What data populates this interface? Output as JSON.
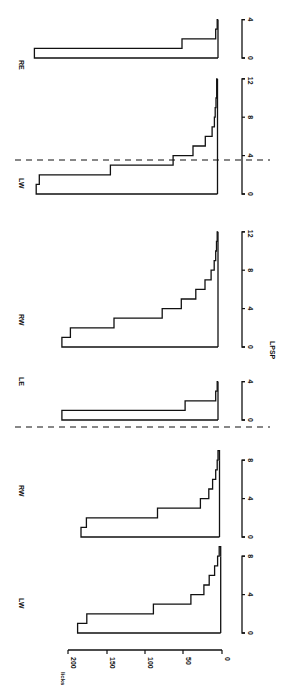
{
  "chart_data": {
    "type": "bar",
    "orientation": "rotated 90deg clockwise (histograms drawn as step outlines)",
    "title": "",
    "xlabel": "LPSP",
    "ylabel": "licks",
    "ylim": [
      0,
      200
    ],
    "yticks": [
      "0",
      "50",
      "100",
      "150",
      "200"
    ],
    "grid": false,
    "legend": null,
    "separators": "dashed lines between the three groups",
    "groups": [
      {
        "panels": [
          {
            "label": "LW",
            "xlim": [
              0,
              8
            ],
            "xticks": [
              "0",
              "4",
              "8"
            ],
            "bins": [
              0,
              1,
              2,
              3,
              4,
              5,
              6,
              7,
              8
            ],
            "values": [
              187,
              175,
              88,
              39,
              22,
              15,
              8,
              4,
              2
            ]
          },
          {
            "label": "RW",
            "xlim": [
              0,
              8
            ],
            "xticks": [
              "0",
              "4",
              "8"
            ],
            "bins": [
              0,
              1,
              2,
              3,
              4,
              5,
              6,
              7,
              8
            ],
            "values": [
              181,
              174,
              81,
              25,
              14,
              9,
              5,
              3,
              2
            ]
          }
        ]
      },
      {
        "panels": [
          {
            "label": "LE",
            "xlim": [
              0,
              4
            ],
            "xticks": [
              "0",
              "4"
            ],
            "bins": [
              0,
              1,
              2,
              3
            ],
            "values": [
              204,
              43,
              3,
              1
            ]
          },
          {
            "label": "RW",
            "xlim": [
              0,
              12
            ],
            "xticks": [
              "0",
              "4",
              "8",
              "12"
            ],
            "bins": [
              0,
              1,
              2,
              3,
              4,
              5,
              6,
              7,
              8,
              9,
              10,
              11
            ],
            "values": [
              204,
              193,
              136,
              73,
              48,
              29,
              17,
              9,
              5,
              3,
              2,
              1
            ]
          }
        ]
      },
      {
        "panels": [
          {
            "label": "LW",
            "xlim": [
              0,
              12
            ],
            "xticks": [
              "0",
              "4",
              "8",
              "12"
            ],
            "bins": [
              0,
              1,
              2,
              3,
              4,
              5,
              6,
              7,
              8,
              9,
              10,
              11
            ],
            "values": [
              237,
              233,
              140,
              58,
              32,
              16,
              7,
              4,
              3,
              2,
              1,
              1
            ]
          },
          {
            "label": "RE",
            "xlim": [
              0,
              4
            ],
            "xticks": [
              "0",
              "4"
            ],
            "bins": [
              0,
              1,
              2,
              3
            ],
            "values": [
              240,
              47,
              3,
              1
            ]
          }
        ]
      }
    ]
  },
  "labels": {
    "y_axis_title": "licks",
    "x_axis_title": "LPSP",
    "panel_lw_1": "LW",
    "panel_rw_1": "RW",
    "panel_le_2": "LE",
    "panel_rw_2": "RW",
    "panel_lw_3": "LW",
    "panel_re_3": "RE",
    "ytick_0": "0",
    "ytick_50": "50",
    "ytick_100": "100",
    "ytick_150": "150",
    "ytick_200": "200",
    "xtick_0": "0",
    "xtick_4": "4",
    "xtick_8": "8",
    "xtick_12": "12"
  }
}
